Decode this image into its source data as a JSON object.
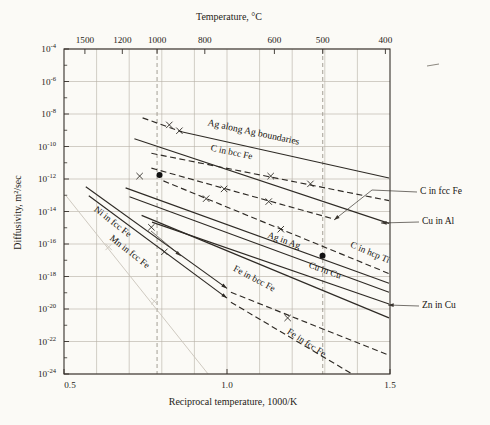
{
  "chart_data": {
    "type": "line",
    "top_axis_title": "Temperature, °C",
    "xlabel": "Reciprocal temperature, 1000/K",
    "ylabel": "Diffusivity, m²/sec",
    "x_range": [
      0.5,
      1.5
    ],
    "y_exp_range": [
      -4,
      -24
    ],
    "grid": "on",
    "x_ticks": [
      {
        "label": "0.5",
        "x": 0.5
      },
      {
        "label": "1.0",
        "x": 1.0
      },
      {
        "label": "1.5",
        "x": 1.5
      }
    ],
    "x_gridlines": [
      0.6,
      0.7,
      0.8,
      0.9,
      1.0,
      1.1,
      1.2,
      1.3,
      1.4
    ],
    "y_tick_exponents": [
      -4,
      -6,
      -8,
      -10,
      -12,
      -14,
      -16,
      -18,
      -20,
      -22,
      -24
    ],
    "y_minor_tick_exponents": [
      -5,
      -7,
      -9,
      -11,
      -13,
      -15,
      -17,
      -19,
      -21,
      -23
    ],
    "top_ticks": [
      {
        "label": "1500",
        "x": 0.5641
      },
      {
        "label": "1200",
        "x": 0.6789
      },
      {
        "label": "1000",
        "x": 0.7855
      },
      {
        "label": "800",
        "x": 0.9319
      },
      {
        "label": "600",
        "x": 1.1454
      },
      {
        "label": "500",
        "x": 1.2937
      },
      {
        "label": "400",
        "x": 1.4859
      }
    ],
    "guide_verticals_x": [
      0.7855,
      1.2937
    ],
    "series": [
      {
        "name": "Ag along Ag boundaries (dashed tip)",
        "style": "dashed",
        "points": [
          [
            0.741,
            -8.24
          ],
          [
            0.862,
            -9.1
          ]
        ],
        "markers": [
          [
            0.823,
            -8.67
          ],
          [
            0.854,
            -9.03
          ]
        ]
      },
      {
        "name": "Ag along Ag boundaries",
        "style": "solid",
        "points": [
          [
            0.86,
            -9.09
          ],
          [
            1.497,
            -11.94
          ]
        ]
      },
      {
        "name": "C in bcc Fe",
        "style": "dashed",
        "points": [
          [
            0.768,
            -10.42
          ],
          [
            1.497,
            -13.33
          ]
        ],
        "markers": [
          [
            1.134,
            -11.82
          ],
          [
            1.256,
            -12.3
          ]
        ]
      },
      {
        "name": "C in fcc Fe",
        "style": "dashed",
        "points": [
          [
            0.768,
            -11.33
          ],
          [
            1.32,
            -14.42
          ]
        ],
        "markers": [
          [
            0.991,
            -12.61
          ],
          [
            1.128,
            -13.39
          ]
        ]
      },
      {
        "name": "Cu in Al",
        "style": "solid",
        "points": [
          [
            0.716,
            -9.52
          ],
          [
            1.497,
            -14.73
          ]
        ]
      },
      {
        "name": "C in hcp Ti",
        "style": "dashed",
        "points": [
          [
            0.805,
            -12.12
          ],
          [
            1.497,
            -17.82
          ]
        ],
        "markers": [
          [
            0.936,
            -13.21
          ],
          [
            1.165,
            -15.09
          ]
        ]
      },
      {
        "name": "Ag in Ag",
        "style": "solid",
        "points": [
          [
            0.689,
            -12.55
          ],
          [
            1.497,
            -18.42
          ]
        ]
      },
      {
        "name": "Cu in Cu",
        "style": "solid",
        "points": [
          [
            0.701,
            -13.09
          ],
          [
            1.497,
            -18.97
          ]
        ]
      },
      {
        "name": "Zn in Cu",
        "style": "solid",
        "points": [
          [
            0.77,
            -14.65
          ],
          [
            1.497,
            -19.69
          ]
        ]
      },
      {
        "name": "Fe in bcc Fe",
        "style": "solid",
        "points": [
          [
            0.738,
            -14.24
          ],
          [
            1.497,
            -20.55
          ]
        ]
      },
      {
        "name": "Ni in fcc Fe",
        "style": "solid",
        "arrow_end": true,
        "points": [
          [
            0.567,
            -12.48
          ],
          [
            1.0,
            -18.73
          ]
        ],
        "markers": [
          [
            0.768,
            -14.97
          ]
        ]
      },
      {
        "name": "Mn in fcc Fe",
        "style": "solid",
        "arrow_end": true,
        "points": [
          [
            0.576,
            -13.03
          ],
          [
            1.0,
            -19.33
          ]
        ],
        "markers": [
          [
            0.808,
            -16.48
          ]
        ]
      },
      {
        "name": "Fe in fcc Fe (upper dashed)",
        "style": "dashed",
        "points": [
          [
            1.012,
            -18.97
          ],
          [
            1.497,
            -22.85
          ]
        ],
        "markers": [
          [
            1.186,
            -20.55
          ]
        ]
      },
      {
        "name": "Fe in fcc Fe (lower dashed)",
        "style": "dashed",
        "points": [
          [
            1.012,
            -19.58
          ],
          [
            1.384,
            -24.0
          ]
        ]
      },
      {
        "name": "unlabeled steep line",
        "style": "faint",
        "points": [
          [
            0.506,
            -13.03
          ],
          [
            0.942,
            -24.0
          ]
        ],
        "markers": [
          [
            0.637,
            -16.18
          ],
          [
            0.777,
            -19.52
          ]
        ]
      }
    ],
    "data_dots": [
      [
        0.793,
        -11.76
      ],
      [
        1.293,
        -16.73
      ]
    ],
    "stray_x_marks": [
      [
        0.732,
        -11.82
      ]
    ],
    "line_labels": [
      {
        "text": "Ag along Ag boundaries",
        "px": 253,
        "py": 135,
        "angle": 12,
        "size": 9.6
      },
      {
        "text": "C in bcc Fe",
        "px": 231,
        "py": 155,
        "angle": 12,
        "size": 9.3
      },
      {
        "text": "C in hcp Ti",
        "px": 369,
        "py": 255,
        "angle": 23,
        "size": 9.3
      },
      {
        "text": "Ag in Ag",
        "px": 283,
        "py": 243,
        "angle": 20,
        "size": 9.3
      },
      {
        "text": "Cu in Cu",
        "px": 324,
        "py": 273,
        "angle": 20,
        "size": 9.3
      },
      {
        "text": "Fe in bcc Fe",
        "px": 253,
        "py": 281,
        "angle": 28,
        "size": 9.3
      },
      {
        "text": "Fe in fcc Fe",
        "px": 305,
        "py": 345,
        "angle": 33,
        "size": 9.3
      },
      {
        "text": "Ni in fcc Fe",
        "px": 111,
        "py": 224,
        "angle": 38,
        "size": 9.3
      },
      {
        "text": "Mn in fcc Fe",
        "px": 128,
        "py": 254,
        "angle": 38,
        "size": 9.3
      }
    ],
    "callouts": [
      {
        "text": "C in fcc Fe",
        "leader_px": [
          [
            417,
            192
          ],
          [
            372,
            190
          ],
          [
            334,
            220
          ]
        ]
      },
      {
        "text": "Cu in Al",
        "leader_px": [
          [
            419,
            222
          ],
          [
            381,
            223
          ]
        ]
      },
      {
        "text": "Zn in Cu",
        "leader_px": [
          [
            419,
            306
          ],
          [
            388,
            305
          ]
        ]
      }
    ],
    "inner_arrows_px": [
      [
        [
          151,
          231
        ],
        [
          181,
          256
        ]
      ]
    ],
    "stray_mark_px": [
      [
        427,
        66
      ],
      [
        439,
        64
      ]
    ],
    "colors": {
      "ink": "#2e2a25",
      "grid": "#b5afa4",
      "guide": "#9a948a",
      "faint": "#c9c4ba",
      "paper": "#fbfaf6"
    }
  }
}
